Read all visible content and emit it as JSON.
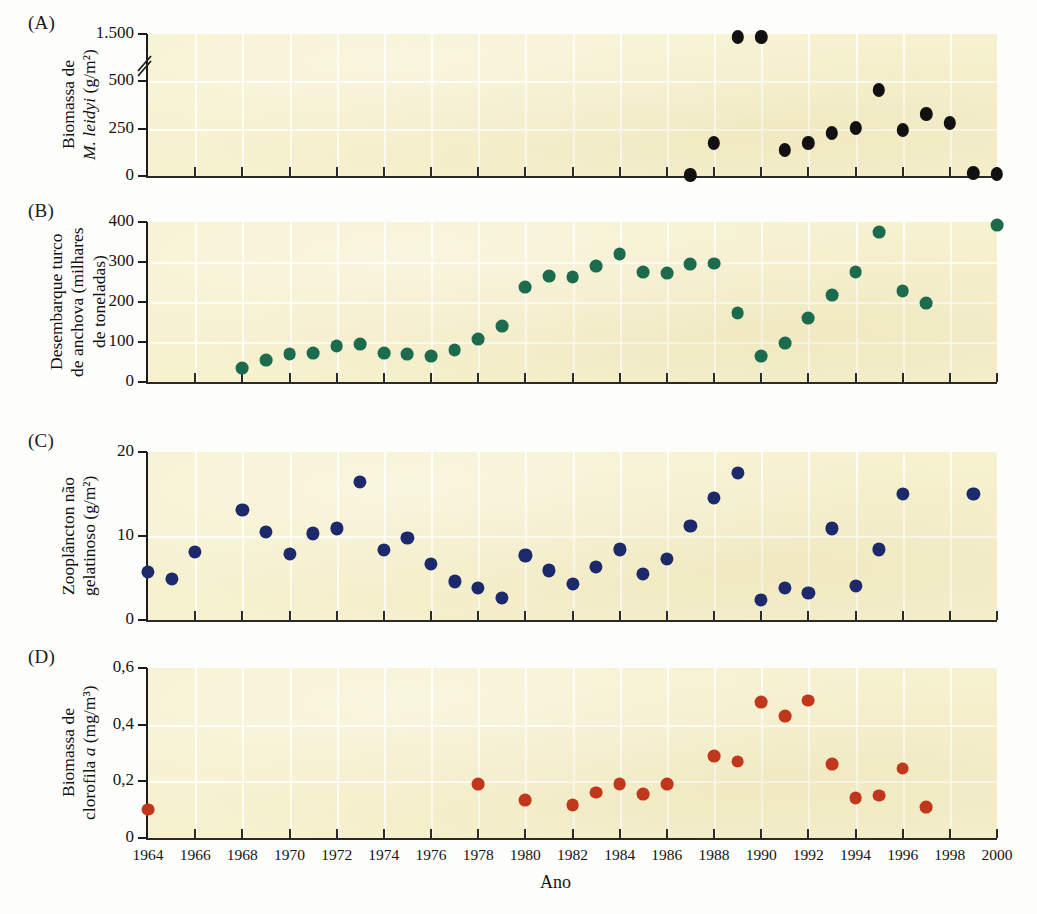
{
  "figure": {
    "xaxis_title": "Ano",
    "panels": [
      {
        "letter": "(A)",
        "ylabel": "Biomassa de\nM. leidyi (g/m2)",
        "ylabel_line1": "Biomassa de",
        "ylabel_line2": "M. leidyi (g/m²)",
        "yticks": [
          "0",
          "250",
          "500",
          "1.500"
        ],
        "has_axis_break": true
      },
      {
        "letter": "(B)",
        "ylabel_line1": "Desembarque turco",
        "ylabel_line2": "de anchova (milhares",
        "ylabel_line3": "de toneladas)",
        "yticks": [
          "0",
          "100",
          "200",
          "300",
          "400"
        ],
        "has_axis_break": false
      },
      {
        "letter": "(C)",
        "ylabel_line1": "Zooplâncton não",
        "ylabel_line2": "gelatinoso (g/m²)",
        "yticks": [
          "0",
          "10",
          "20"
        ],
        "has_axis_break": false
      },
      {
        "letter": "(D)",
        "ylabel_line1": "Biomassa de",
        "ylabel_line2": "clorofila a (mg/m³)",
        "yticks": [
          "0",
          "0,2",
          "0,4",
          "0,6"
        ],
        "has_axis_break": false
      }
    ],
    "xticks": [
      "1964",
      "1966",
      "1968",
      "1970",
      "1972",
      "1974",
      "1976",
      "1978",
      "1980",
      "1982",
      "1984",
      "1986",
      "1988",
      "1990",
      "1992",
      "1994",
      "1996",
      "1998",
      "2000"
    ],
    "colors": {
      "panel_a": "#111111",
      "panel_b": "#1d6b4f",
      "panel_c": "#1c2a6b",
      "panel_d": "#c0371c",
      "plot_background": "#f6f1cf",
      "gridline": "#ffffff"
    },
    "bleed_text": [
      {
        "t": "Um momento propicio de casos",
        "x": 404,
        "y": 286,
        "s": 24,
        "b": true
      },
      {
        "t": "HAVE",
        "x": 878,
        "y": 290,
        "s": 26,
        "b": true,
        "mirror": true
      },
      {
        "t": "Em 1980 a nova espécie de ctenoforo M. leidyi",
        "x": 252,
        "y": 318,
        "s": 16
      },
      {
        "t": "adores",
        "x": 900,
        "y": 330,
        "s": 16,
        "mirror": true
      },
      {
        "t": "no Mar Negro, provavelmente pelo despejo de água de lastro",
        "x": 240,
        "y": 342,
        "s": 16
      },
      {
        "t": "sional",
        "x": 900,
        "y": 352,
        "s": 16,
        "mirror": true
      },
      {
        "t": "cargueiros. O momento desse evento não poderia ter",
        "x": 248,
        "y": 366,
        "s": 16
      },
      {
        "t": "ciclos",
        "x": 905,
        "y": 478,
        "s": 16,
        "mirror": true
      },
      {
        "t": "níveis bentônicos inicialmente, com os itens (ver p. 240-265)",
        "x": 230,
        "y": 482,
        "s": 15
      },
      {
        "t": "Ctenoforo pode ter contribuído para o declínio do ecossistema",
        "x": 228,
        "y": 508,
        "s": 15
      },
      {
        "t": "dos mais desastrosos, os preços do pescado na costa do",
        "x": 236,
        "y": 532,
        "s": 15
      },
      {
        "t": "idade",
        "x": 908,
        "y": 544,
        "s": 16,
        "mirror": true
      },
      {
        "t": "onde as comunidades marinhas de benéficas espetaculares",
        "x": 232,
        "y": 554,
        "s": 15
      },
      {
        "t": "a problemática causada pela turbidez com aumento",
        "x": 244,
        "y": 578,
        "s": 15
      },
      {
        "t": "o dor",
        "x": 905,
        "y": 592,
        "s": 16,
        "mirror": true
      },
      {
        "t": "e que o processo nutritivo destes ecossistemas a maior dim",
        "x": 232,
        "y": 600,
        "s": 15
      },
      {
        "t": "neo de",
        "x": 902,
        "y": 700,
        "s": 16,
        "mirror": true
      },
      {
        "t": "dominam tanto e as populações de peixes sofreram me drasticamente",
        "x": 222,
        "y": 706,
        "s": 15
      },
      {
        "t": "io em",
        "x": 906,
        "y": 726,
        "s": 16,
        "mirror": true
      },
      {
        "t": "nhuma vez mais os predadores naturais da água, provindas do Mar Me",
        "x": 220,
        "y": 732,
        "s": 15
      },
      {
        "t": "os",
        "x": 912,
        "y": 756,
        "s": 16,
        "mirror": true
      },
      {
        "t": "anos, causando aumento na biomassa de fitoplâncton.",
        "x": 244,
        "y": 758,
        "s": 15
      },
      {
        "t": "os de",
        "x": 904,
        "y": 784,
        "s": 16,
        "mirror": true
      },
      {
        "t": "tem manifestado das consequências em um",
        "x": 252,
        "y": 784,
        "s": 15
      },
      {
        "t": "Ctenoforo a situação mudou de novo. Essa espécie",
        "x": 248,
        "y": 810,
        "s": 15
      },
      {
        "t": "enta",
        "x": 908,
        "y": 820,
        "s": 16,
        "mirror": true
      }
    ]
  },
  "chart_data": [
    {
      "type": "scatter",
      "panel": "A",
      "title": "",
      "xlabel": "Ano",
      "ylabel": "Biomassa de M. leidyi (g/m2)",
      "xlim": [
        1964,
        2000
      ],
      "ylim": [
        0,
        750
      ],
      "ytick_values": [
        0,
        250,
        500,
        750
      ],
      "ytick_labels": [
        "0",
        "250",
        "500",
        "1.500"
      ],
      "axis_break_between": [
        "500",
        "1.500"
      ],
      "color": "#111111",
      "grid": true,
      "x": [
        1987,
        1988,
        1989,
        1990,
        1991,
        1992,
        1993,
        1994,
        1995,
        1996,
        1997,
        1998,
        1999,
        2000
      ],
      "y": [
        5,
        175,
        1500,
        1500,
        135,
        175,
        225,
        255,
        455,
        245,
        330,
        280,
        15,
        10
      ]
    },
    {
      "type": "scatter",
      "panel": "B",
      "title": "",
      "xlabel": "Ano",
      "ylabel": "Desembarque turco de anchova (milhares de toneladas)",
      "xlim": [
        1964,
        2000
      ],
      "ylim": [
        0,
        400
      ],
      "ytick_values": [
        0,
        100,
        200,
        300,
        400
      ],
      "color": "#1d6b4f",
      "grid": true,
      "x": [
        1968,
        1969,
        1970,
        1971,
        1972,
        1973,
        1974,
        1975,
        1976,
        1977,
        1978,
        1979,
        1980,
        1981,
        1982,
        1983,
        1984,
        1985,
        1986,
        1987,
        1988,
        1989,
        1990,
        1991,
        1992,
        1993,
        1994,
        1995,
        1996,
        1997,
        2000
      ],
      "y": [
        35,
        55,
        70,
        73,
        90,
        95,
        72,
        70,
        65,
        80,
        108,
        140,
        238,
        265,
        262,
        290,
        320,
        275,
        272,
        295,
        296,
        172,
        65,
        98,
        160,
        218,
        275,
        375,
        228,
        198,
        392
      ]
    },
    {
      "type": "scatter",
      "panel": "C",
      "title": "",
      "xlabel": "Ano",
      "ylabel": "Zooplancton nao gelatinoso (g/m2)",
      "xlim": [
        1964,
        2000
      ],
      "ylim": [
        0,
        20
      ],
      "ytick_values": [
        0,
        10,
        20
      ],
      "color": "#1c2a6b",
      "grid": true,
      "x": [
        1964,
        1965,
        1966,
        1968,
        1969,
        1970,
        1971,
        1972,
        1973,
        1974,
        1975,
        1976,
        1977,
        1978,
        1979,
        1980,
        1981,
        1982,
        1983,
        1984,
        1985,
        1986,
        1987,
        1988,
        1989,
        1990,
        1991,
        1992,
        1993,
        1994,
        1995,
        1996,
        1999
      ],
      "y": [
        5.7,
        4.9,
        8.1,
        13.1,
        10.5,
        7.9,
        10.3,
        10.9,
        16.4,
        8.3,
        9.8,
        6.7,
        4.6,
        3.8,
        2.6,
        7.7,
        5.9,
        4.3,
        6.3,
        8.4,
        5.5,
        7.3,
        11.2,
        14.5,
        17.5,
        2.4,
        3.8,
        3.2,
        10.9,
        4.1,
        8.4,
        15.0,
        15.0
      ]
    },
    {
      "type": "scatter",
      "panel": "D",
      "title": "",
      "xlabel": "Ano",
      "ylabel": "Biomassa de clorofila a (mg/m3)",
      "xlim": [
        1964,
        2000
      ],
      "ylim": [
        0,
        0.6
      ],
      "ytick_values": [
        0,
        0.2,
        0.4,
        0.6
      ],
      "color": "#c0371c",
      "grid": true,
      "x": [
        1964,
        1978,
        1980,
        1982,
        1983,
        1984,
        1985,
        1986,
        1988,
        1989,
        1990,
        1991,
        1992,
        1993,
        1994,
        1995,
        1996,
        1997
      ],
      "y": [
        0.1,
        0.19,
        0.135,
        0.115,
        0.16,
        0.19,
        0.155,
        0.19,
        0.29,
        0.27,
        0.48,
        0.43,
        0.485,
        0.26,
        0.14,
        0.15,
        0.245,
        0.11
      ]
    }
  ]
}
